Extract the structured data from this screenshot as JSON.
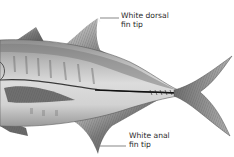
{
  "illustration": {
    "subject": "fish illustration (side view, rear half)",
    "background_color": "#ffffff",
    "labels": [
      {
        "id": "dorsal",
        "line1": "White dorsal",
        "line2": "fin tip"
      },
      {
        "id": "anal",
        "line1": "White anal",
        "line2": "fin tip"
      }
    ]
  }
}
